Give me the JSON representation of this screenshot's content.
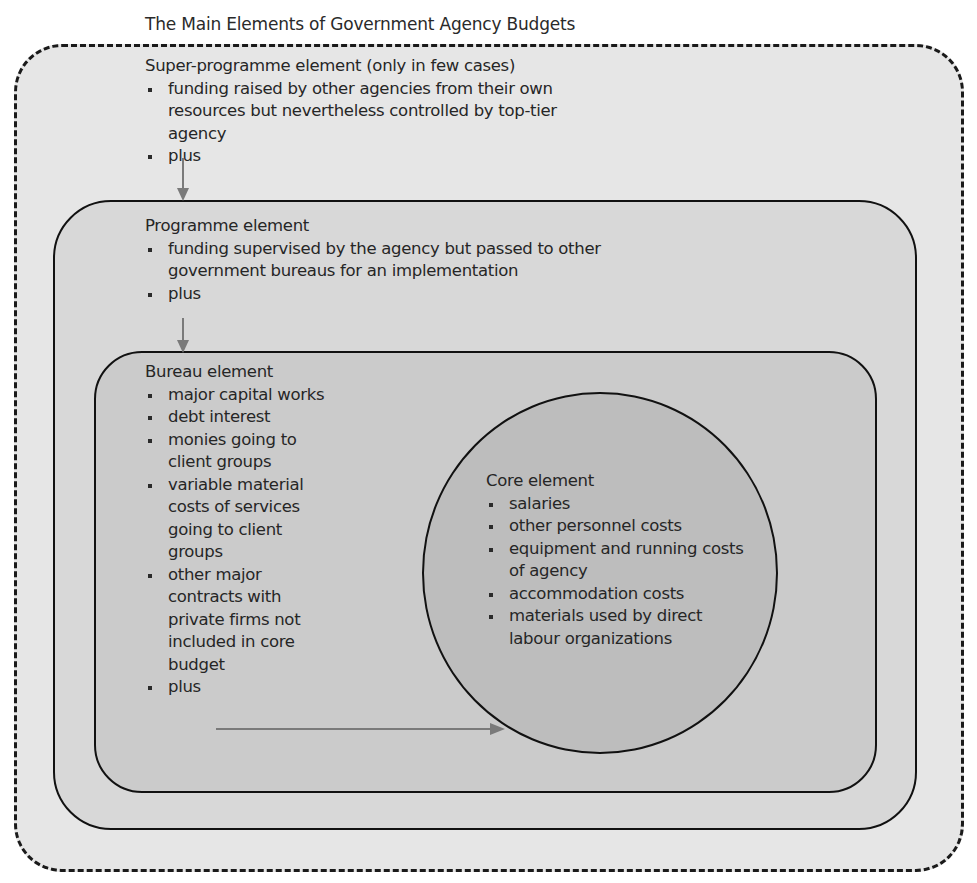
{
  "title": "The Main Elements of Government Agency Budgets",
  "colors": {
    "super_fill": "#e6e6e6",
    "programme_fill": "#d8d8d8",
    "bureau_fill": "#cbcbcb",
    "core_fill": "#bdbdbd",
    "outline": "#111111",
    "arrow": "#7a7a7a",
    "text": "#262626"
  },
  "super_programme": {
    "heading": "Super-programme element (only in few cases)",
    "items": [
      "funding raised by other agencies from their own resources but nevertheless controlled by top-tier agency",
      "plus"
    ]
  },
  "programme": {
    "heading": "Programme element",
    "items": [
      "funding supervised by the agency but passed to other government bureaus for an implementation",
      "plus"
    ]
  },
  "bureau": {
    "heading": "Bureau element",
    "items": [
      "major capital works",
      "debt interest",
      "monies going to client groups",
      "variable material costs of services going to client groups",
      "other major contracts with private firms not included in core budget",
      "plus"
    ]
  },
  "core": {
    "heading": "Core element",
    "items": [
      "salaries",
      "other personnel costs",
      "equipment and running costs of agency",
      "accommodation costs",
      "materials used by direct labour organizations"
    ]
  },
  "arrows": [
    {
      "from": "super_programme.plus",
      "to": "programme",
      "direction": "down"
    },
    {
      "from": "programme.plus",
      "to": "bureau",
      "direction": "down"
    },
    {
      "from": "bureau.plus",
      "to": "core",
      "direction": "right"
    }
  ]
}
